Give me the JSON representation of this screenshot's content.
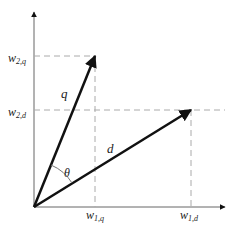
{
  "diagram": {
    "vectors": [
      {
        "id": "q",
        "label": "q",
        "x1_label": "w1,q",
        "x2_label": "w2,q"
      },
      {
        "id": "d",
        "label": "d",
        "x1_label": "w1,d",
        "x2_label": "w2,d"
      }
    ],
    "angle_label": "θ",
    "labels": {
      "w2q_main": "w",
      "w2q_sub": "2,q",
      "w2d_main": "w",
      "w2d_sub": "2,d",
      "w1q_main": "w",
      "w1q_sub": "1,q",
      "w1d_main": "w",
      "w1d_sub": "1,d",
      "q": "q",
      "d": "d",
      "theta": "θ"
    },
    "colors": {
      "axis": "#555555",
      "vector": "#111111",
      "guide": "#aaaaaa",
      "arc": "#777777"
    }
  }
}
